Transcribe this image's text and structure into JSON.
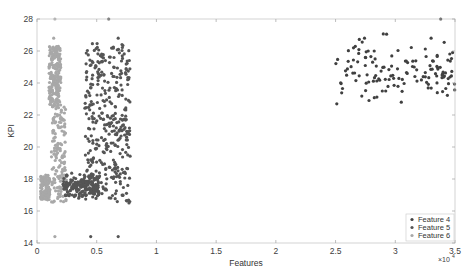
{
  "chart_data": {
    "type": "scatter",
    "title": "",
    "xlabel": "Features",
    "ylabel": "KPI",
    "x_exponent_label": "×10^4",
    "xlim": [
      0,
      35000
    ],
    "ylim": [
      14,
      28
    ],
    "xticks": [
      0,
      5000,
      10000,
      15000,
      20000,
      25000,
      30000,
      35000
    ],
    "xtick_labels": [
      "0",
      "0.5",
      "1",
      "1.5",
      "2",
      "2.5",
      "3",
      "3.5"
    ],
    "yticks": [
      14,
      16,
      18,
      20,
      22,
      24,
      26,
      28
    ],
    "ytick_labels": [
      "14",
      "16",
      "18",
      "20",
      "22",
      "24",
      "26",
      "28"
    ],
    "grid": false,
    "legend_position": "lower right",
    "series": [
      {
        "name": "Feature 4",
        "color": "#404040",
        "description": "Sparse cluster at x≈25000–35000, y≈22.5–27",
        "clusters": [
          {
            "x_range": [
              25000,
              35000
            ],
            "y_center": 24.8,
            "y_spread": 0.9,
            "count": 130
          }
        ],
        "points": [
          [
            25100,
            22.7
          ],
          [
            26500,
            26.2
          ],
          [
            30500,
            22.8
          ],
          [
            29200,
            23.5
          ],
          [
            33000,
            26.8
          ],
          [
            34800,
            25.9
          ],
          [
            27500,
            25.6
          ],
          [
            31000,
            24.6
          ],
          [
            33800,
            28.0
          ]
        ]
      },
      {
        "name": "Feature 5",
        "color": "#555555",
        "description": "Dense cluster at x≈3000–8000, y≈16.5–26.5 with a blob at y≈17.5",
        "clusters": [
          {
            "x_range": [
              4000,
              7800
            ],
            "y_range": [
              18.0,
              26.5
            ],
            "count": 330
          },
          {
            "x_range": [
              2200,
              5200
            ],
            "y_center": 17.5,
            "y_spread": 0.35,
            "count": 200
          },
          {
            "x_range": [
              4000,
              7800
            ],
            "y_range": [
              16.5,
              18.2
            ],
            "count": 40
          }
        ],
        "points": [
          [
            4500,
            14.4
          ],
          [
            6800,
            14.4
          ],
          [
            6000,
            28.0
          ],
          [
            6800,
            26.8
          ],
          [
            7700,
            16.5
          ],
          [
            7200,
            17.0
          ]
        ]
      },
      {
        "name": "Feature 6",
        "color": "#a8a8a8",
        "description": "Narrow vertical band at x≈500–2000, y≈16.5–27",
        "clusters": [
          {
            "x_range": [
              1000,
              2000
            ],
            "y_range": [
              22.5,
              26.3
            ],
            "count": 220
          },
          {
            "x_range": [
              1200,
              2400
            ],
            "y_range": [
              18.0,
              22.5
            ],
            "count": 110
          },
          {
            "x_range": [
              300,
              1100
            ],
            "y_range": [
              16.7,
              18.3
            ],
            "count": 110
          },
          {
            "x_range": [
              1200,
              2500
            ],
            "y_range": [
              16.5,
              18.0
            ],
            "count": 40
          }
        ],
        "points": [
          [
            1500,
            14.4
          ],
          [
            1400,
            26.8
          ],
          [
            1500,
            28.0
          ]
        ]
      }
    ]
  },
  "legend": {
    "items": [
      "Feature 4",
      "Feature 5",
      "Feature 6"
    ]
  }
}
